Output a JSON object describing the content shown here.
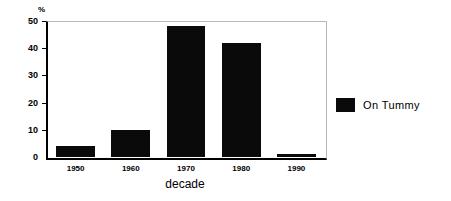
{
  "chart_data": {
    "type": "bar",
    "title": "",
    "subtitle": "",
    "xlabel": "decade",
    "ylabel": "%",
    "categories": [
      "1950",
      "1960",
      "1970",
      "1980",
      "1990"
    ],
    "values": [
      4,
      10,
      48,
      42,
      1
    ],
    "series": [
      {
        "name": "On Tummy",
        "values": [
          4,
          10,
          48,
          42,
          1
        ],
        "color": "#0a0a0a"
      }
    ],
    "ylim": [
      0,
      50
    ],
    "yticks": [
      "0",
      "10",
      "20",
      "30",
      "40",
      "50"
    ],
    "grid": false,
    "legend": {
      "position": "right",
      "entries": [
        {
          "label": "On Tummy",
          "color": "#0a0a0a"
        }
      ]
    },
    "axis_color": "#000000",
    "frame_color": "#b9b9b9",
    "background": "#ffffff"
  }
}
